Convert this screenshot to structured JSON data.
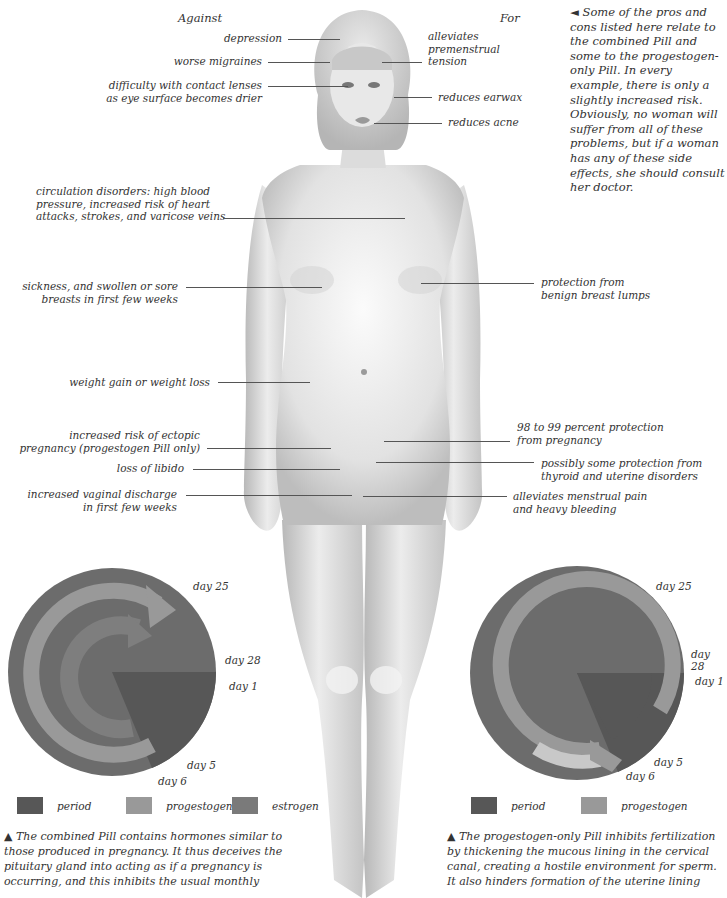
{
  "headers": {
    "against": "Against",
    "for": "For"
  },
  "against_labels": [
    {
      "text": "depression"
    },
    {
      "text": "worse migraines"
    },
    {
      "line1": "difficulty with contact lenses",
      "line2": "as eye surface becomes drier"
    },
    {
      "line1": "circulation disorders: high blood",
      "line2": "pressure, increased risk of heart",
      "line3": "attacks, strokes, and varicose veins"
    },
    {
      "line1": "sickness, and swollen or sore",
      "line2": "breasts in first few weeks"
    },
    {
      "text": "weight gain or weight loss"
    },
    {
      "line1": "increased risk of ectopic",
      "line2": "pregnancy (progestogen Pill only)"
    },
    {
      "text": "loss of libido"
    },
    {
      "line1": "increased vaginal discharge",
      "line2": "in first few weeks"
    }
  ],
  "for_labels": [
    {
      "line1": "alleviates",
      "line2": "premenstrual",
      "line3": "tension"
    },
    {
      "text": "reduces earwax"
    },
    {
      "text": "reduces acne"
    },
    {
      "line1": "protection from",
      "line2": "benign breast lumps"
    },
    {
      "line1": "98 to 99 percent protection",
      "line2": "from pregnancy"
    },
    {
      "line1": "possibly some protection from",
      "line2": "thyroid and uterine disorders"
    },
    {
      "line1": "alleviates menstrual pain",
      "line2": "and heavy bleeding"
    }
  ],
  "side_note": "◄ Some of the pros and cons listed here relate to the combined Pill and some to the progestogen-only Pill. In every example, there is only a slightly increased risk. Obviously, no woman will suffer from all of these problems, but if a woman has any of these side effects, she should consult her doctor.",
  "combined_pill_chart": {
    "days": {
      "d25": "day 25",
      "d28": "day 28",
      "d1": "day 1",
      "d5": "day 5",
      "d6": "day 6"
    },
    "legend": [
      {
        "label": "period",
        "color": "#5a5a5a"
      },
      {
        "label": "progestogen",
        "color": "#9a9a9a"
      },
      {
        "label": "estrogen",
        "color": "#787878"
      }
    ],
    "caption": "▲ The combined Pill contains hormones similar to those produced in pregnancy. It thus deceives the pituitary gland into acting as if a pregnancy is occurring, and this inhibits the usual monthly"
  },
  "progestogen_pill_chart": {
    "days": {
      "d25": "day 25",
      "d28": "day 28",
      "d1": "day 1",
      "d5": "day 5",
      "d6": "day 6"
    },
    "legend": [
      {
        "label": "period",
        "color": "#5a5a5a"
      },
      {
        "label": "progestogen",
        "color": "#9a9a9a"
      }
    ],
    "caption": "▲ The progestogen-only Pill inhibits fertilization by thickening the mucous lining in the cervical canal, creating a hostile environment for sperm. It also hinders formation of the uterine lining"
  },
  "colors": {
    "disc": "#6c6c6c",
    "period": "#575757",
    "progestogen": "#999999",
    "estrogen": "#7a7a7a",
    "leader": "#555555"
  }
}
